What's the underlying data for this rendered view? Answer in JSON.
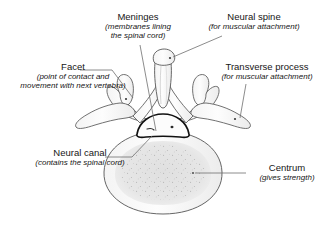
{
  "figure": {
    "background_color": "#ffffff",
    "outline_color": "#4a4a4a",
    "leader_line_color": "#6f6f6f",
    "neural_canal_outline_color": "#111111",
    "bone_fill_color": "#fbfbfb",
    "centrum_inner_fill_color": "#e3e3e3",
    "speckle_color": "#9a9a9a"
  },
  "callouts": {
    "meninges": {
      "term": "Meninges",
      "desc_line1": "(membranes lining",
      "desc_line2": "the spinal cord)"
    },
    "neural_spine": {
      "term": "Neural spine",
      "desc_line1": "(for muscular attachment)"
    },
    "facet": {
      "term": "Facet",
      "desc_line1": "(point of contact and",
      "desc_line2": "movement with next vertebra)"
    },
    "transverse_process": {
      "term": "Transverse process",
      "desc_line1": "(for muscular attachment)"
    },
    "neural_canal": {
      "term": "Neural canal",
      "desc_line1": "(contains the spinal cord)"
    },
    "centrum": {
      "term": "Centrum",
      "desc_line1": "(gives strength)"
    }
  }
}
